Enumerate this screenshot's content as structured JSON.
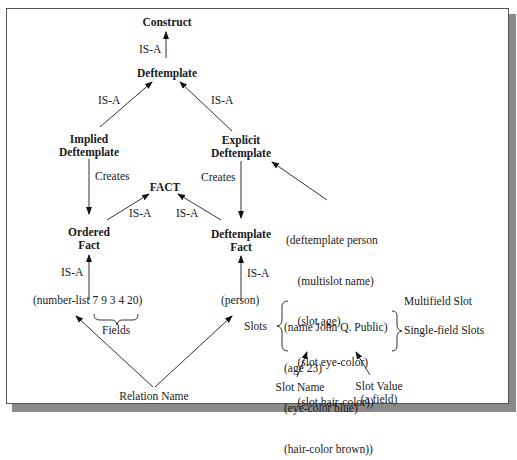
{
  "nodes": {
    "construct": "Construct",
    "deftemplate": "Deftemplate",
    "implied_deftemplate": [
      "Implied",
      "Deftemplate"
    ],
    "explicit_deftemplate": [
      "Explicit",
      "Deftemplate"
    ],
    "fact": "FACT",
    "ordered_fact": [
      "Ordered",
      "Fact"
    ],
    "deftemplate_fact": [
      "Deftemplate",
      "Fact"
    ]
  },
  "edge_labels": {
    "isa": "IS-A",
    "creates": "Creates"
  },
  "deftemplate_definition": [
    "(deftemplate person",
    "    (multislot name)",
    "    (slot age)",
    "    (slot eye-color)",
    "    (slot hair-color))"
  ],
  "ordered_example": {
    "relation": "(number-list",
    "fields": "7 9 3 4 20)",
    "fields_label": "Fields"
  },
  "deftemplate_example": {
    "relation": "(person)",
    "slots_label": "Slots",
    "slots": [
      "(name John Q. Public)",
      "(age 23)",
      "(eye-color blue)",
      "(hair-color brown))"
    ],
    "multifield_label": "Multifield Slot",
    "singlefield_label": "Single-field Slots"
  },
  "annotations": {
    "relation_name": "Relation Name",
    "slot_name": "Slot Name",
    "slot_value": [
      "Slot Value",
      "(a field)"
    ]
  }
}
